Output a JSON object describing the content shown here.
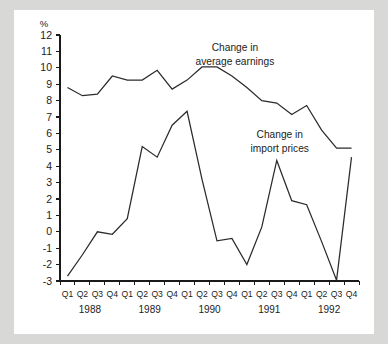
{
  "chart_data": {
    "type": "line",
    "title": "",
    "xlabel": "",
    "ylabel": "%",
    "unit_label": "%",
    "ylim": [
      -3,
      12
    ],
    "ytick_step": 1,
    "grid": false,
    "legend_position": "inline-annotations",
    "x": [
      "Q1 1988",
      "Q2 1988",
      "Q3 1988",
      "Q4 1988",
      "Q1 1989",
      "Q2 1989",
      "Q3 1989",
      "Q4 1989",
      "Q1 1990",
      "Q2 1990",
      "Q3 1990",
      "Q4 1990",
      "Q1 1991",
      "Q2 1991",
      "Q3 1991",
      "Q4 1991",
      "Q1 1992",
      "Q2 1992",
      "Q3 1992",
      "Q4 1992"
    ],
    "quarter_labels": [
      "Q1",
      "Q2",
      "Q3",
      "Q4",
      "Q1",
      "Q2",
      "Q3",
      "Q4",
      "Q1",
      "Q2",
      "Q3",
      "Q4",
      "Q1",
      "Q2",
      "Q3",
      "Q4",
      "Q1",
      "Q2",
      "Q3",
      "Q4"
    ],
    "year_labels": [
      "1988",
      "1989",
      "1990",
      "1991",
      "1992"
    ],
    "ytick_labels": [
      "12",
      "11",
      "10",
      "9",
      "8",
      "7",
      "6",
      "5",
      "4",
      "3",
      "2",
      "1",
      "0",
      "-1",
      "-2",
      "-3"
    ],
    "ytick_values": [
      12,
      11,
      10,
      9,
      8,
      7,
      6,
      5,
      4,
      3,
      2,
      1,
      0,
      -1,
      -2,
      -3
    ],
    "series": [
      {
        "name": "Change in average earnings",
        "color": "#2b2b2b",
        "values": [
          8.8,
          8.3,
          8.4,
          9.5,
          9.25,
          9.25,
          9.85,
          8.7,
          9.25,
          10.05,
          10.05,
          9.5,
          8.8,
          8.0,
          7.85,
          7.15,
          7.7,
          6.2,
          5.1,
          5.1
        ]
      },
      {
        "name": "Change in import prices",
        "color": "#2b2b2b",
        "values": [
          -2.7,
          -1.4,
          0.0,
          -0.15,
          0.8,
          5.2,
          4.55,
          6.5,
          7.35,
          3.2,
          -0.55,
          -0.4,
          -2.0,
          0.3,
          4.35,
          1.9,
          1.65,
          -0.6,
          -2.95,
          4.55
        ]
      }
    ],
    "annotations": [
      {
        "name": "average-earnings",
        "lines": [
          "Change in",
          "average earnings"
        ],
        "x_quarter_index": 11.2,
        "y_value": 11.05
      },
      {
        "name": "import-prices",
        "lines": [
          "Change in",
          "import prices"
        ],
        "x_quarter_index": 14.2,
        "y_value": 5.75
      }
    ]
  }
}
